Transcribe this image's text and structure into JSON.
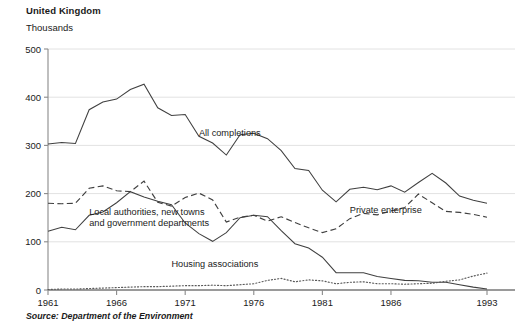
{
  "header": {
    "title": "United Kingdom",
    "units_label": "Thousands"
  },
  "footer": {
    "source": "Source: Department of the Environment"
  },
  "chart_data": {
    "type": "line",
    "title": "United Kingdom",
    "subtitle": "Thousands",
    "xlabel": "",
    "ylabel": "Thousands",
    "xlim": [
      1961,
      1993
    ],
    "ylim": [
      0,
      500
    ],
    "yticks": [
      0,
      100,
      200,
      300,
      400,
      500
    ],
    "ytick_labels": [
      "0",
      "100",
      "200",
      "300",
      "400",
      "500"
    ],
    "xticks": [
      1961,
      1966,
      1971,
      1976,
      1981,
      1986,
      1993
    ],
    "xtick_labels": [
      "1961",
      "1966",
      "1971",
      "1976",
      "1981",
      "1986",
      "1993"
    ],
    "grid": true,
    "legend": "inline-annotations",
    "x": [
      1961,
      1962,
      1963,
      1964,
      1965,
      1966,
      1967,
      1968,
      1969,
      1970,
      1971,
      1972,
      1973,
      1974,
      1975,
      1976,
      1977,
      1978,
      1979,
      1980,
      1981,
      1982,
      1983,
      1984,
      1985,
      1986,
      1987,
      1988,
      1989,
      1990,
      1991,
      1992,
      1993
    ],
    "series": [
      {
        "name": "All completions",
        "style": "solid",
        "label_x": 1972,
        "label_y": 320,
        "values": [
          303,
          306,
          304,
          374,
          390,
          396,
          416,
          427,
          378,
          362,
          364,
          319,
          305,
          280,
          322,
          325,
          314,
          289,
          252,
          248,
          207,
          183,
          209,
          213,
          208,
          216,
          203,
          223,
          242,
          222,
          195,
          186,
          180
        ]
      },
      {
        "name": "Private enterprise",
        "style": "dashed",
        "label_x": 1983,
        "label_y": 160,
        "values": [
          180,
          179,
          180,
          211,
          216,
          206,
          204,
          226,
          182,
          174,
          192,
          201,
          187,
          141,
          151,
          155,
          143,
          152,
          140,
          129,
          119,
          127,
          148,
          159,
          156,
          164,
          171,
          199,
          181,
          163,
          161,
          157,
          151
        ]
      },
      {
        "name": "Local authorities, new towns and government departments",
        "style": "solid",
        "label_x": 1964,
        "label_y": 155,
        "values": [
          122,
          130,
          125,
          155,
          162,
          181,
          204,
          193,
          184,
          177,
          139,
          117,
          101,
          119,
          150,
          155,
          152,
          123,
          96,
          87,
          68,
          36,
          36,
          36,
          28,
          24,
          20,
          19,
          16,
          16,
          11,
          6,
          2
        ]
      },
      {
        "name": "Housing associations",
        "style": "dotted",
        "label_x": 1970,
        "label_y": 48,
        "values": [
          1,
          2,
          2,
          3,
          4,
          5,
          6,
          7,
          7,
          8,
          9,
          9,
          10,
          9,
          11,
          13,
          20,
          24,
          17,
          21,
          19,
          13,
          16,
          17,
          13,
          13,
          12,
          13,
          14,
          18,
          21,
          29,
          35
        ]
      }
    ]
  }
}
